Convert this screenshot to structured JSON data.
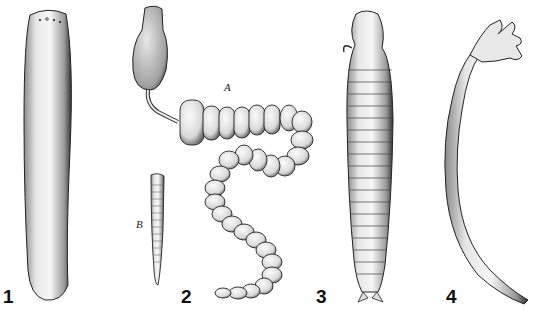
{
  "figure": {
    "panels": [
      {
        "number": "1",
        "subject": "smooth elongated worm with small eyespots at anterior end"
      },
      {
        "number": "2",
        "subject": "segmented chain organism with head on stalk (A) and small ringed larva (B)",
        "sublabels": [
          "A",
          "B"
        ]
      },
      {
        "number": "3",
        "subject": "ringed worm with hooked head appendages and forked tail"
      },
      {
        "number": "4",
        "subject": "curved ringed worm with branched finger-like anterior end"
      }
    ]
  },
  "labels": {
    "fig1": "1",
    "fig2": "2",
    "fig3": "3",
    "fig4": "4",
    "sub_a": "A",
    "sub_b": "B"
  },
  "colors": {
    "background": "#ffffff",
    "ink": "#111111",
    "shade": "#555555"
  }
}
